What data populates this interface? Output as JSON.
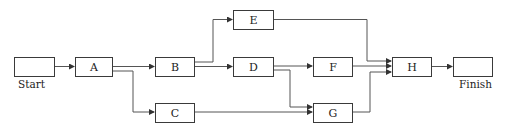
{
  "diagram": {
    "type": "activity-on-node precedence network",
    "nodes": [
      {
        "id": "start",
        "label": "",
        "caption": "Start"
      },
      {
        "id": "A",
        "label": "A"
      },
      {
        "id": "B",
        "label": "B"
      },
      {
        "id": "C",
        "label": "C"
      },
      {
        "id": "D",
        "label": "D"
      },
      {
        "id": "E",
        "label": "E"
      },
      {
        "id": "F",
        "label": "F"
      },
      {
        "id": "G",
        "label": "G"
      },
      {
        "id": "H",
        "label": "H"
      },
      {
        "id": "finish",
        "label": "",
        "caption": "Finish"
      }
    ],
    "edges": [
      [
        "Start",
        "A"
      ],
      [
        "A",
        "B"
      ],
      [
        "A",
        "C"
      ],
      [
        "B",
        "E"
      ],
      [
        "B",
        "D"
      ],
      [
        "D",
        "F"
      ],
      [
        "D",
        "G"
      ],
      [
        "C",
        "G"
      ],
      [
        "E",
        "H"
      ],
      [
        "F",
        "H"
      ],
      [
        "G",
        "H"
      ],
      [
        "H",
        "Finish"
      ]
    ],
    "line_color": "#3a3a3a"
  }
}
